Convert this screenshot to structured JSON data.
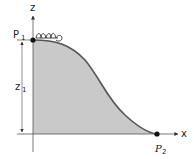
{
  "diagram": {
    "labels": {
      "z_axis": "z",
      "x_axis": "x",
      "p1_main": "P",
      "p1_sub": "1",
      "p2_main": "P",
      "p2_sub": "2",
      "z1_main": "z",
      "z1_sub": "1"
    },
    "colors": {
      "fill": "#c9c9c9",
      "curve": "#555555",
      "axis": "#333333",
      "point": "#111111"
    },
    "points": [
      {
        "name": "P1",
        "x": 33,
        "y": 40
      },
      {
        "name": "P2",
        "x": 157,
        "y": 134
      }
    ]
  }
}
